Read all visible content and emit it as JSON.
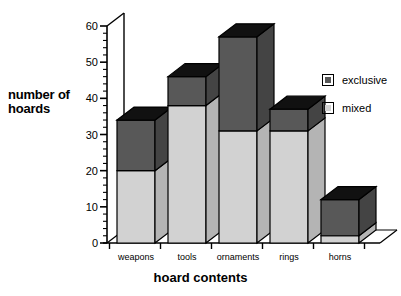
{
  "chart_data": {
    "type": "bar",
    "subtype": "stacked-3d-column",
    "title": "",
    "xlabel": "hoard contents",
    "ylabel": "number of hoards",
    "categories": [
      "weapons",
      "tools",
      "ornaments",
      "rings",
      "horns"
    ],
    "series": [
      {
        "name": "mixed",
        "color": "#d2d2d2",
        "values": [
          20,
          38,
          31,
          31,
          2
        ]
      },
      {
        "name": "exclusive",
        "color": "#585858",
        "values": [
          14,
          8,
          26,
          6,
          10
        ]
      }
    ],
    "totals": [
      34,
      46,
      57,
      37,
      12
    ],
    "ylim": [
      0,
      60
    ],
    "yticks": [
      0,
      10,
      20,
      30,
      40,
      50,
      60
    ],
    "ytick_labels": [
      "0",
      "10",
      "20",
      "30",
      "40",
      "50",
      "60"
    ],
    "minor_tick_step": 2,
    "grid": false,
    "legend_position": "right",
    "stack_order": [
      "mixed",
      "exclusive"
    ]
  },
  "axes": {
    "y_title_line1": "number of",
    "y_title_line2": "hoards",
    "x_title": "hoard contents"
  },
  "legend": {
    "items": [
      {
        "label": "exclusive",
        "swatch": "dark-gray-square"
      },
      {
        "label": "mixed",
        "swatch": "light-gray-square"
      }
    ]
  },
  "colors": {
    "mixed_face": "#d2d2d2",
    "exclusive_face": "#585858",
    "top_face": "#111111",
    "side_face_mixed": "#b4b4b4",
    "side_face_exclusive": "#444444",
    "outline": "#000000",
    "background": "#ffffff"
  }
}
